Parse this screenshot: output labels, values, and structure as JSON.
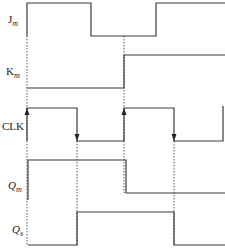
{
  "diagram": {
    "type": "timing-diagram",
    "signals": [
      {
        "id": "jm",
        "label": "J",
        "subscript": "m",
        "italic": false
      },
      {
        "id": "km",
        "label": "K",
        "subscript": "m",
        "italic": false
      },
      {
        "id": "clk",
        "label": "CLK",
        "subscript": "",
        "italic": false
      },
      {
        "id": "qm",
        "label": "Q",
        "subscript": "m",
        "italic": true
      },
      {
        "id": "qs",
        "label": "Q",
        "subscript": "s",
        "italic": true
      }
    ],
    "waveforms": {
      "jm": "M27,36 L27,3 L91,3 L91,36 L156,36 L156,3 L225,3",
      "km": "M27,88 L124,88 L124,55 L225,55",
      "clk": "M27,141 L27,108 L77,108 L77,141 L124,141 L124,108 L174,108 L174,141 L223,141 L223,106",
      "qm": "M28,200 L28,160 L126,160 L126,193 L225,193",
      "qs": "M28,245 L77,245 L77,212 L174,212 L174,245 L225,245"
    },
    "guides": [
      {
        "x": 27,
        "y1": 36,
        "y2": 245
      },
      {
        "x": 77,
        "y1": 141,
        "y2": 245
      },
      {
        "x": 124,
        "y1": 36,
        "y2": 141
      },
      {
        "x": 124,
        "y1": 141,
        "y2": 193
      },
      {
        "x": 174,
        "y1": 141,
        "y2": 245
      }
    ],
    "clock_edges": [
      {
        "x": 27,
        "y": 108,
        "direction": "up"
      },
      {
        "x": 77,
        "y": 141,
        "direction": "down"
      },
      {
        "x": 124,
        "y": 108,
        "direction": "up"
      },
      {
        "x": 174,
        "y": 141,
        "direction": "down"
      }
    ],
    "colors": {
      "line": "#3a3a3a",
      "text": "#222222",
      "background": "#ffffff"
    }
  }
}
